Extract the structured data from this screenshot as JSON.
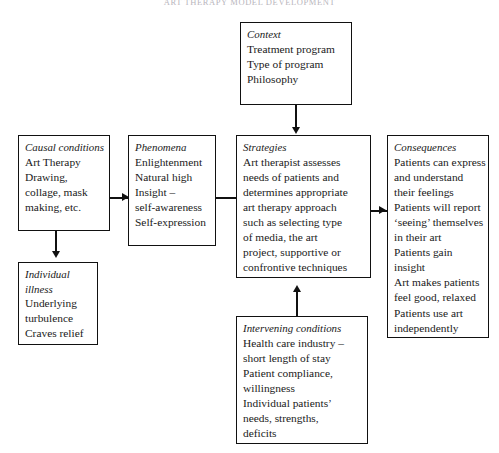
{
  "page": {
    "running_head": "ART THERAPY MODEL DEVELOPMENT"
  },
  "diagram": {
    "type": "flowchart",
    "boxes": {
      "context": {
        "heading": "Context",
        "lines": [
          "Treatment program",
          "Type of program",
          "Philosophy"
        ]
      },
      "causal_conditions": {
        "heading": "Causal conditions",
        "lines": [
          "Art Therapy",
          "Drawing,",
          "collage, mask",
          "making, etc."
        ]
      },
      "individual_illness": {
        "heading_lines": [
          "Individual",
          "illness"
        ],
        "lines": [
          "Underlying",
          "turbulence",
          "Craves relief"
        ]
      },
      "phenomena": {
        "heading": "Phenomena",
        "lines": [
          "Enlightenment",
          "Natural high",
          "Insight –",
          "self-awareness",
          "Self-expression"
        ]
      },
      "strategies": {
        "heading": "Strategies",
        "lines": [
          "Art therapist assesses",
          "needs of patients and",
          "determines appropriate",
          "art therapy approach",
          "such as selecting type",
          "of media, the art",
          "project, supportive or",
          "confrontive techniques"
        ]
      },
      "consequences": {
        "heading": "Consequences",
        "lines": [
          "Patients can express",
          "and understand",
          "their feelings",
          "Patients will report",
          "‘seeing’ themselves",
          "in their art",
          "Patients gain",
          "insight",
          "Art makes patients",
          "feel good, relaxed",
          "Patients use art",
          "independently"
        ]
      },
      "intervening_conditions": {
        "heading": "Intervening conditions",
        "lines": [
          "Health care industry –",
          "short length of stay",
          "Patient compliance,",
          "willingness",
          "Individual patients’",
          "needs, strengths,",
          "deficits"
        ]
      }
    },
    "colors": {
      "border": "#111111",
      "text": "#1a1a1a",
      "background": "#ffffff"
    }
  }
}
